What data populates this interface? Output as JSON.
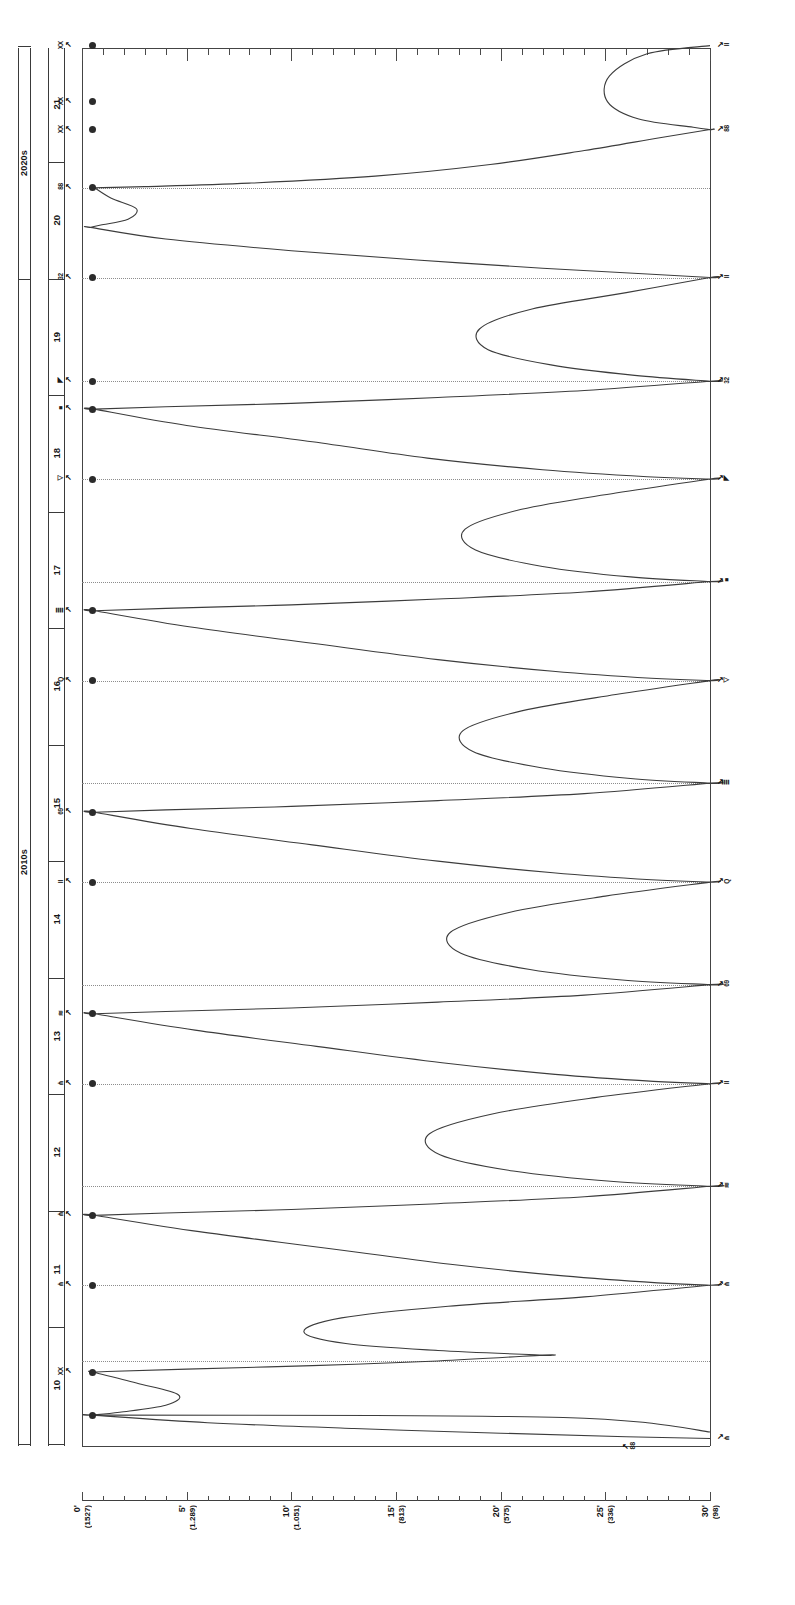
{
  "figure": {
    "orientation": "rotated-90-ccw",
    "background": "#ffffff",
    "ink": "#1a1a1a"
  },
  "time_axis": {
    "name": "year-axis",
    "decades": [
      {
        "label": "2020s",
        "start_year": 20,
        "end_year": 21
      },
      {
        "label": "2010s",
        "start_year": 10,
        "end_year": 19
      }
    ],
    "years": [
      "21",
      "20",
      "19",
      "18",
      "17",
      "16",
      "15",
      "14",
      "13",
      "12",
      "11",
      "10"
    ]
  },
  "value_axis": {
    "name": "value-axis",
    "ticks": [
      {
        "primary": "0'",
        "secondary": "(1527)"
      },
      {
        "primary": "5'",
        "secondary": "(1.289)"
      },
      {
        "primary": "10'",
        "secondary": "(1.051)"
      },
      {
        "primary": "15'",
        "secondary": "(813)"
      },
      {
        "primary": "20'",
        "secondary": "(575)"
      },
      {
        "primary": "25'",
        "secondary": "(336)"
      },
      {
        "primary": "30'",
        "secondary": "(98)"
      }
    ],
    "minor_per_major": 5
  },
  "annotations": {
    "left": [
      {
        "label": "XX",
        "arrow": "↖"
      },
      {
        "label": "XX",
        "arrow": "↖"
      },
      {
        "label": "XX",
        "arrow": "↖"
      },
      {
        "label": "88",
        "arrow": "↖"
      },
      {
        "label": "32",
        "arrow": "↖"
      },
      {
        "label": "◥",
        "arrow": "↖"
      },
      {
        "label": "■",
        "arrow": "↖"
      },
      {
        "label": "◁",
        "arrow": "↖"
      },
      {
        "label": "≣",
        "arrow": "↖"
      },
      {
        "label": "Q",
        "arrow": "↖"
      },
      {
        "label": "69",
        "arrow": "↖"
      },
      {
        "label": "II",
        "arrow": "↖"
      },
      {
        "label": "≋",
        "arrow": "↖"
      },
      {
        "label": "⋔",
        "arrow": "↖"
      },
      {
        "label": "⋔",
        "arrow": "↖"
      },
      {
        "label": "⋔",
        "arrow": "↖"
      },
      {
        "label": "XX",
        "arrow": "↖"
      }
    ],
    "right": [
      {
        "arrow": "↗",
        "label": "II"
      },
      {
        "arrow": "↗",
        "label": "88"
      },
      {
        "arrow": "↗",
        "label": "II"
      },
      {
        "arrow": "↗",
        "label": "32"
      },
      {
        "arrow": "↗",
        "label": "◥"
      },
      {
        "arrow": "↗",
        "label": "■"
      },
      {
        "arrow": "↗",
        "label": "◁"
      },
      {
        "arrow": "↗",
        "label": "≣"
      },
      {
        "arrow": "↗",
        "label": "Q"
      },
      {
        "arrow": "↗",
        "label": "69"
      },
      {
        "arrow": "↗",
        "label": "II"
      },
      {
        "arrow": "↗",
        "label": "≋"
      },
      {
        "arrow": "↗",
        "label": "⋔"
      },
      {
        "arrow": "↗",
        "label": "⋔"
      },
      {
        "arrow": "↗",
        "label": "⋔"
      },
      {
        "arrow": "↗",
        "label": "88"
      }
    ],
    "interior_note": {
      "arrow": "↖",
      "label": "88"
    }
  },
  "chart_data": {
    "type": "line",
    "title": "",
    "xlabel": "",
    "ylabel": "",
    "orientation": "vertical-time",
    "grid": "horizontal-dotted",
    "legend": "none",
    "xlim": [
      0,
      30
    ],
    "ylim_years": [
      21.6,
      9.6
    ],
    "x_tick_labels": [
      "0'",
      "5'",
      "10'",
      "15'",
      "20'",
      "25'",
      "30'"
    ],
    "x_tick_secondary": [
      "(1527)",
      "(1.289)",
      "(1.051)",
      "(813)",
      "(575)",
      "(336)",
      "(98)"
    ],
    "y_tick_labels": [
      "21",
      "20",
      "19",
      "18",
      "17",
      "16",
      "15",
      "14",
      "13",
      "12",
      "11",
      "10"
    ],
    "series": [
      {
        "name": "serpentine-path",
        "comment": "continuous oscillating curve; x in value-units 0..30, y in year-units",
        "points": [
          [
            30.0,
            21.62
          ],
          [
            27.0,
            21.55
          ],
          [
            25.2,
            21.36
          ],
          [
            25.1,
            21.14
          ],
          [
            26.6,
            20.99
          ],
          [
            29.2,
            20.92
          ],
          [
            30.0,
            20.9
          ],
          [
            30.0,
            20.9
          ],
          [
            27.6,
            20.83
          ],
          [
            24.0,
            20.72
          ],
          [
            19.5,
            20.6
          ],
          [
            14.0,
            20.5
          ],
          [
            8.0,
            20.44
          ],
          [
            3.0,
            20.41
          ],
          [
            0.6,
            20.4
          ],
          [
            0.6,
            20.4
          ],
          [
            1.4,
            20.31
          ],
          [
            2.6,
            20.22
          ],
          [
            2.2,
            20.13
          ],
          [
            0.9,
            20.08
          ],
          [
            0.4,
            20.06
          ],
          [
            0.4,
            20.06
          ],
          [
            4.0,
            19.96
          ],
          [
            10.0,
            19.86
          ],
          [
            16.0,
            19.78
          ],
          [
            22.0,
            19.71
          ],
          [
            27.0,
            19.66
          ],
          [
            30.0,
            19.63
          ],
          [
            30.0,
            19.63
          ],
          [
            26.0,
            19.5
          ],
          [
            21.5,
            19.36
          ],
          [
            19.0,
            19.19
          ],
          [
            19.4,
            19.01
          ],
          [
            22.4,
            18.88
          ],
          [
            26.4,
            18.79
          ],
          [
            30.0,
            18.74
          ],
          [
            30.0,
            18.74
          ],
          [
            24.0,
            18.66
          ],
          [
            17.0,
            18.6
          ],
          [
            10.0,
            18.55
          ],
          [
            4.0,
            18.52
          ],
          [
            0.6,
            18.5
          ],
          [
            0.6,
            18.5
          ],
          [
            5.0,
            18.36
          ],
          [
            11.0,
            18.22
          ],
          [
            16.5,
            18.08
          ],
          [
            22.0,
            17.98
          ],
          [
            27.0,
            17.92
          ],
          [
            30.0,
            17.9
          ],
          [
            30.0,
            17.9
          ],
          [
            25.5,
            17.78
          ],
          [
            21.0,
            17.64
          ],
          [
            18.3,
            17.47
          ],
          [
            18.8,
            17.29
          ],
          [
            22.0,
            17.15
          ],
          [
            26.2,
            17.06
          ],
          [
            30.0,
            17.02
          ],
          [
            30.0,
            17.02
          ],
          [
            24.0,
            16.93
          ],
          [
            17.0,
            16.87
          ],
          [
            10.0,
            16.82
          ],
          [
            4.0,
            16.79
          ],
          [
            0.6,
            16.77
          ],
          [
            0.6,
            16.77
          ],
          [
            5.2,
            16.63
          ],
          [
            11.0,
            16.49
          ],
          [
            17.0,
            16.35
          ],
          [
            22.5,
            16.25
          ],
          [
            27.2,
            16.19
          ],
          [
            30.0,
            16.17
          ],
          [
            30.0,
            16.17
          ],
          [
            25.5,
            16.05
          ],
          [
            21.0,
            15.91
          ],
          [
            18.2,
            15.74
          ],
          [
            18.7,
            15.56
          ],
          [
            22.0,
            15.42
          ],
          [
            26.2,
            15.33
          ],
          [
            30.0,
            15.29
          ],
          [
            30.0,
            15.29
          ],
          [
            24.0,
            15.2
          ],
          [
            17.0,
            15.14
          ],
          [
            10.0,
            15.09
          ],
          [
            4.0,
            15.06
          ],
          [
            0.6,
            15.04
          ],
          [
            0.6,
            15.04
          ],
          [
            5.2,
            14.9
          ],
          [
            11.0,
            14.76
          ],
          [
            17.0,
            14.62
          ],
          [
            22.5,
            14.52
          ],
          [
            27.2,
            14.46
          ],
          [
            30.0,
            14.44
          ],
          [
            30.0,
            14.44
          ],
          [
            25.0,
            14.32
          ],
          [
            20.4,
            14.18
          ],
          [
            17.6,
            14.01
          ],
          [
            18.1,
            13.83
          ],
          [
            21.4,
            13.69
          ],
          [
            25.8,
            13.6
          ],
          [
            30.0,
            13.56
          ],
          [
            30.0,
            13.56
          ],
          [
            24.0,
            13.47
          ],
          [
            17.0,
            13.41
          ],
          [
            10.0,
            13.36
          ],
          [
            4.0,
            13.33
          ],
          [
            0.6,
            13.31
          ],
          [
            0.6,
            13.31
          ],
          [
            5.4,
            13.17
          ],
          [
            11.2,
            13.03
          ],
          [
            17.2,
            12.89
          ],
          [
            22.6,
            12.79
          ],
          [
            27.3,
            12.73
          ],
          [
            30.0,
            12.71
          ],
          [
            30.0,
            12.71
          ],
          [
            24.5,
            12.59
          ],
          [
            19.6,
            12.45
          ],
          [
            16.6,
            12.28
          ],
          [
            17.1,
            12.1
          ],
          [
            20.6,
            11.96
          ],
          [
            25.4,
            11.87
          ],
          [
            30.0,
            11.83
          ],
          [
            30.0,
            11.83
          ],
          [
            24.0,
            11.74
          ],
          [
            17.0,
            11.68
          ],
          [
            10.0,
            11.63
          ],
          [
            4.0,
            11.6
          ],
          [
            0.6,
            11.58
          ],
          [
            0.6,
            11.58
          ],
          [
            5.6,
            11.44
          ],
          [
            11.6,
            11.3
          ],
          [
            17.6,
            11.16
          ],
          [
            23.0,
            11.06
          ],
          [
            27.5,
            11.0
          ],
          [
            30.0,
            10.98
          ],
          [
            30.0,
            10.98
          ],
          [
            24.0,
            10.88
          ],
          [
            17.5,
            10.8
          ],
          [
            12.4,
            10.7
          ],
          [
            10.6,
            10.58
          ],
          [
            12.6,
            10.48
          ],
          [
            17.0,
            10.42
          ],
          [
            22.0,
            10.38
          ],
          [
            22.0,
            10.38
          ],
          [
            17.0,
            10.33
          ],
          [
            11.0,
            10.29
          ],
          [
            5.0,
            10.26
          ],
          [
            1.2,
            10.24
          ],
          [
            0.5,
            10.235
          ],
          [
            0.5,
            10.235
          ],
          [
            2.6,
            10.14
          ],
          [
            4.6,
            10.04
          ],
          [
            4.0,
            9.95
          ],
          [
            1.8,
            9.89
          ],
          [
            0.5,
            9.865
          ],
          [
            0.5,
            9.865
          ],
          [
            6.0,
            9.8
          ],
          [
            13.0,
            9.75
          ],
          [
            20.0,
            9.71
          ],
          [
            26.0,
            9.68
          ],
          [
            30.0,
            9.665
          ]
        ]
      },
      {
        "name": "baseline-flat",
        "comment": "near-horizontal segment along the bottom frame",
        "points": [
          [
            0.5,
            9.865
          ],
          [
            14.0,
            9.862
          ],
          [
            23.0,
            9.845
          ],
          [
            27.0,
            9.8
          ],
          [
            30.0,
            9.72
          ]
        ]
      }
    ],
    "markers": {
      "name": "left-axis-dots",
      "x": 0.5,
      "years": [
        21.62,
        21.14,
        20.9,
        20.4,
        19.63,
        18.74,
        18.5,
        17.9,
        16.77,
        16.17,
        15.04,
        14.44,
        13.31,
        12.71,
        11.58,
        10.98,
        10.235,
        9.865
      ]
    },
    "guides_years": [
      20.4,
      19.63,
      18.74,
      17.9,
      17.02,
      16.17,
      15.29,
      14.44,
      13.56,
      12.71,
      11.83,
      10.98,
      10.33
    ]
  }
}
